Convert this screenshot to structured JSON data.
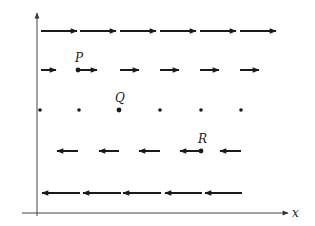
{
  "diagram": {
    "type": "vector-field",
    "colors": {
      "ink": "#1a1a1a",
      "axis": "#444444",
      "background": "#ffffff"
    },
    "axes": {
      "x_label": "x",
      "y_axis": {
        "x": 37,
        "y_top": 13,
        "y_bottom": 216
      },
      "x_axis": {
        "y": 213,
        "x_left": 22,
        "x_right": 288
      }
    },
    "rows": [
      {
        "name": "row-1",
        "direction": "right",
        "y": 31,
        "arrows": [
          [
            41,
            77
          ],
          [
            80,
            116
          ],
          [
            120,
            156
          ],
          [
            160,
            196
          ],
          [
            200,
            236
          ],
          [
            240,
            276
          ]
        ]
      },
      {
        "name": "row-2",
        "direction": "right",
        "y": 70,
        "arrows": [
          [
            41,
            56
          ],
          [
            78,
            97
          ],
          [
            120,
            139
          ],
          [
            160,
            179
          ],
          [
            200,
            219
          ],
          [
            240,
            259
          ]
        ]
      },
      {
        "name": "row-3",
        "direction": "none",
        "y": 110,
        "dots": [
          40,
          79,
          119,
          160,
          201,
          241
        ]
      },
      {
        "name": "row-4",
        "direction": "left",
        "y": 151,
        "arrows": [
          [
            57,
            78
          ],
          [
            99,
            119
          ],
          [
            139,
            160
          ],
          [
            180,
            201
          ],
          [
            220,
            241
          ]
        ]
      },
      {
        "name": "row-5",
        "direction": "left",
        "y": 193,
        "arrows": [
          [
            42,
            80
          ],
          [
            83,
            121
          ],
          [
            123,
            161
          ],
          [
            165,
            202
          ],
          [
            205,
            242
          ]
        ]
      }
    ],
    "points": [
      {
        "label": "P",
        "x": 78,
        "y": 70,
        "label_x": 75,
        "label_y": 62
      },
      {
        "label": "Q",
        "x": 119,
        "y": 110,
        "label_x": 115,
        "label_y": 102
      },
      {
        "label": "R",
        "x": 201,
        "y": 151,
        "label_x": 198,
        "label_y": 143
      }
    ]
  }
}
